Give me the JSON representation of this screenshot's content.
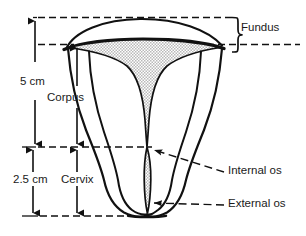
{
  "figure": {
    "type": "anatomical-line-diagram",
    "background_color": "#ffffff",
    "stroke_color": "#111111",
    "cavity_fill_color": "#d9d9d9",
    "labels": {
      "fundus": "Fundus",
      "corpus": "Corpus",
      "cervix": "Cervix",
      "internal_os": "Internal os",
      "external_os": "External os"
    },
    "measurements": {
      "corpus_length": "5 cm",
      "cervix_length": "2.5 cm"
    },
    "icons": {
      "fundus_brace": "curly-brace-icon",
      "corpus_dimension": "double-arrow-vertical-icon",
      "cervix_dimension": "double-arrow-vertical-icon",
      "internal_os_leader": "dashed-leader-arrow-icon",
      "external_os_leader": "dashed-leader-arrow-icon"
    }
  }
}
